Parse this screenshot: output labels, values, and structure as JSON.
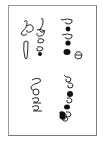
{
  "card": {
    "border_color": "#9a9a9a",
    "background": "#ffffff",
    "ink_color": "#111111",
    "description": "Rotated handwritten glyph specimen"
  },
  "glyph_groups": [
    {
      "name": "upper-left",
      "glyphs": [
        "ascender-loop",
        "ascender-loop",
        "loop",
        "loop",
        "teardrop",
        "filled-dot"
      ]
    },
    {
      "name": "upper-right",
      "glyphs": [
        "open-note",
        "filled-note",
        "open-note",
        "filled-note",
        "filled-note",
        "open-circle"
      ]
    },
    {
      "name": "lower-left",
      "glyphs": [
        "open-loop",
        "circle",
        "open-note",
        "open-note"
      ]
    },
    {
      "name": "lower-right",
      "glyphs": [
        "open-note",
        "open-note",
        "filled-note",
        "open-note",
        "filled-note",
        "filled-note",
        "open-note"
      ]
    }
  ]
}
